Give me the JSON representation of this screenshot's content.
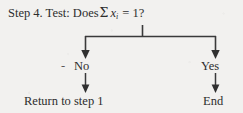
{
  "diagram": {
    "type": "flowchart",
    "background_color": "#f2f1ef",
    "ink_color": "#2d2d2d",
    "line_color": "#3a3a3a",
    "question": {
      "prefix": "Step 4. Test: Does",
      "sigma": "Σ",
      "variable": "x",
      "subscript": "i",
      "equals": "= 1?",
      "full_text": "Step 4. Test: Does Σ xᵢ = 1?"
    },
    "branches": [
      {
        "label": "No",
        "leading_mark": "-",
        "target": "Return to step 1"
      },
      {
        "label": "Yes",
        "leading_mark": "",
        "target": "End"
      }
    ],
    "outcomes": {
      "no_outcome": "Return to step 1",
      "yes_outcome": "End"
    }
  }
}
